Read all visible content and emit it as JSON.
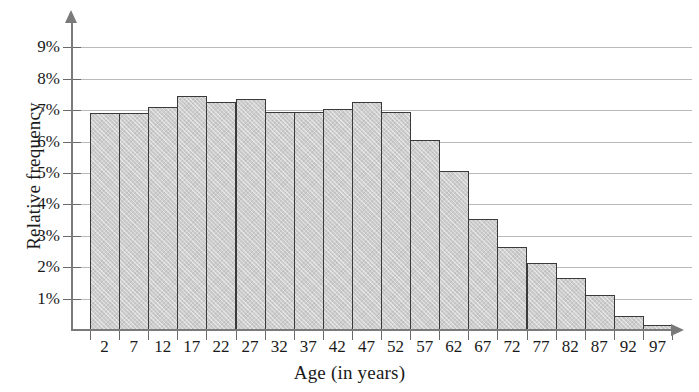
{
  "chart_data": {
    "type": "bar",
    "title": "",
    "subtitle": "",
    "xlabel": "Age (in years)",
    "ylabel": "Relative frequency",
    "categories": [
      "2",
      "7",
      "12",
      "17",
      "22",
      "27",
      "32",
      "37",
      "42",
      "47",
      "52",
      "57",
      "62",
      "67",
      "72",
      "77",
      "82",
      "87",
      "92",
      "97"
    ],
    "values": [
      6.9,
      6.9,
      7.1,
      7.45,
      7.25,
      7.35,
      6.95,
      6.95,
      7.05,
      7.25,
      6.95,
      6.05,
      5.05,
      3.55,
      2.65,
      2.15,
      1.65,
      1.1,
      0.45,
      0.15
    ],
    "value_suffix": "%",
    "ylim": [
      0,
      9.7
    ],
    "ytick_values": [
      1,
      2,
      3,
      4,
      5,
      6,
      7,
      8,
      9
    ],
    "ytick_labels": [
      "1%",
      "2%",
      "3%",
      "4%",
      "5%",
      "6%",
      "7%",
      "8%",
      "9%"
    ],
    "grid": "horizontal",
    "legend": "none",
    "bar_fill_color": "#cdcdcd",
    "bar_edge_color": "#3a3a3a",
    "gridline_color": "#b9b9b9",
    "axis_color": "#7a7a7a"
  }
}
